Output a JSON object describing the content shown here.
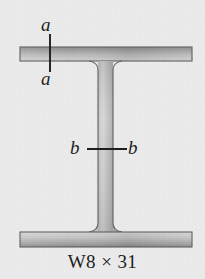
{
  "figure": {
    "name": "wide-flange-beam-cross-section",
    "caption": "W8 × 31",
    "background_color": "#ececec"
  },
  "section_cuts": [
    {
      "id": "a-a",
      "orientation": "vertical",
      "label_start": "a",
      "label_end": "a",
      "through": "top-flange"
    },
    {
      "id": "b-b",
      "orientation": "horizontal",
      "label_start": "b",
      "label_end": "b",
      "through": "web"
    }
  ],
  "labels": {
    "a_top": "a",
    "a_bottom": "a",
    "b_left": "b",
    "b_right": "b"
  },
  "colors": {
    "line": "#1c1c1c",
    "outline": "#5a5a5a",
    "flange_top_dark": "#8e8e8e",
    "flange_top_light": "#cfcfcf",
    "flange_bottom_light": "#d2d2d2",
    "flange_bottom_dark": "#8a8a8a",
    "web_edge": "#8d8d8d",
    "web_center": "#d4d4d4",
    "text": "#1a1a1a"
  },
  "geometry": {
    "flange_left_x": 20,
    "flange_right_x": 192,
    "top_flange_y": 47,
    "top_flange_bottom_y": 61,
    "bottom_flange_y": 232,
    "bottom_flange_bottom_y": 247,
    "web_left_x": 98,
    "web_right_x": 113,
    "fillet_radius": 9
  }
}
